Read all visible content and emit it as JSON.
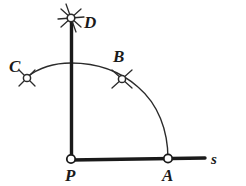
{
  "figure": {
    "background_color": "#ffffff",
    "ink_color": "#1a1a1a",
    "width": 246,
    "height": 186
  },
  "labels": {
    "P": "P",
    "A": "A",
    "B": "B",
    "C": "C",
    "D": "D",
    "s": "s"
  },
  "points": [
    {
      "id": "P",
      "label": "P",
      "x": 71,
      "y": 160,
      "marker": "open-circle",
      "label_x": 67,
      "label_y": 180
    },
    {
      "id": "A",
      "label": "A",
      "x": 168,
      "y": 159,
      "marker": "open-circle",
      "label_x": 164,
      "label_y": 180
    },
    {
      "id": "B",
      "label": "B",
      "x": 122,
      "y": 79,
      "marker": "open-circle",
      "label_x": 113,
      "label_y": 62
    },
    {
      "id": "C",
      "label": "C",
      "x": 27,
      "y": 78,
      "marker": "open-circle",
      "label_x": 11,
      "label_y": 72
    },
    {
      "id": "D",
      "label": "D",
      "x": 71,
      "y": 18,
      "marker": "open-circle",
      "label_x": 84,
      "label_y": 28
    }
  ],
  "lines": [
    {
      "id": "ray-s",
      "name": "horizontal-ray-s",
      "x1": 71,
      "y1": 160,
      "x2": 205,
      "y2": 158,
      "width": 3.2
    },
    {
      "id": "line-PD",
      "name": "vertical-line-PD",
      "x1": 71,
      "y1": 160,
      "x2": 71,
      "y2": 16,
      "width": 3.2
    }
  ],
  "arcs": [
    {
      "id": "arc-PA",
      "name": "main-arc-centered-at-P",
      "center_x": 71,
      "center_y": 160,
      "radius": 97,
      "start_deg": 0,
      "end_deg": 115,
      "width": 1.3
    }
  ],
  "tick_marks": [
    {
      "id": "ticks-B",
      "name": "compass-cross-marks-B",
      "x": 122,
      "y": 79,
      "count": 4,
      "length": 13
    },
    {
      "id": "ticks-C",
      "name": "compass-cross-marks-C",
      "x": 27,
      "y": 78,
      "count": 4,
      "length": 13
    },
    {
      "id": "ticks-D",
      "name": "compass-star-marks-D",
      "x": 71,
      "y": 18,
      "count": 6,
      "length": 16
    }
  ],
  "ray_label": {
    "text": "s",
    "x": 212,
    "y": 163
  }
}
